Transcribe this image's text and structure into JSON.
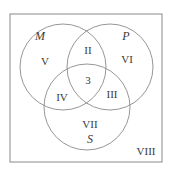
{
  "diagram": {
    "type": "venn",
    "colors": {
      "line": "#8a8a8a",
      "text": "#3a3a3a",
      "background": "#ffffff"
    },
    "universe": {
      "label": "VIII",
      "x": 10,
      "y": 14,
      "w": 152,
      "h": 148
    },
    "sets": [
      {
        "name": "M",
        "cx": 63,
        "cy": 67,
        "r": 43,
        "label_x": 40,
        "label_y": 37
      },
      {
        "name": "P",
        "cx": 110,
        "cy": 67,
        "r": 43,
        "label_x": 126,
        "label_y": 37
      },
      {
        "name": "S",
        "cx": 87,
        "cy": 107,
        "r": 43,
        "label_x": 90,
        "label_y": 140
      }
    ],
    "regions": [
      {
        "id": "V",
        "label": "V",
        "x": 45,
        "y": 62
      },
      {
        "id": "II",
        "label": "II",
        "x": 88,
        "y": 51
      },
      {
        "id": "VI",
        "label": "VI",
        "x": 127,
        "y": 60
      },
      {
        "id": "center",
        "label": "3",
        "x": 88,
        "y": 81
      },
      {
        "id": "IV",
        "label": "IV",
        "x": 62,
        "y": 98
      },
      {
        "id": "III",
        "label": "III",
        "x": 112,
        "y": 95
      },
      {
        "id": "VII",
        "label": "VII",
        "x": 90,
        "y": 125
      },
      {
        "id": "VIII",
        "label": "VIII",
        "x": 146,
        "y": 152
      }
    ]
  }
}
